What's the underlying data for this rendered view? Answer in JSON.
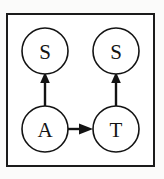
{
  "figure": {
    "background_color": "#fbfbfa",
    "frame_color": "#1b1b1b",
    "frame_fill": "#ffffff",
    "stroke_color": "#131313"
  },
  "graph": {
    "nodes": [
      {
        "id": "s-top-left",
        "label": "S",
        "cx": 45,
        "cy": 51,
        "r": 23
      },
      {
        "id": "s-top-right",
        "label": "S",
        "cx": 116,
        "cy": 51,
        "r": 23
      },
      {
        "id": "a-bottom-left",
        "label": "A",
        "cx": 45,
        "cy": 129,
        "r": 23
      },
      {
        "id": "t-bottom-right",
        "label": "T",
        "cx": 116,
        "cy": 129,
        "r": 23
      }
    ],
    "edges": [
      {
        "id": "edge-a-to-s-left",
        "from": "A",
        "to": "S",
        "direction": "up"
      },
      {
        "id": "edge-t-to-s-right",
        "from": "T",
        "to": "S",
        "direction": "up"
      },
      {
        "id": "edge-a-to-t",
        "from": "A",
        "to": "T",
        "direction": "right"
      }
    ]
  }
}
